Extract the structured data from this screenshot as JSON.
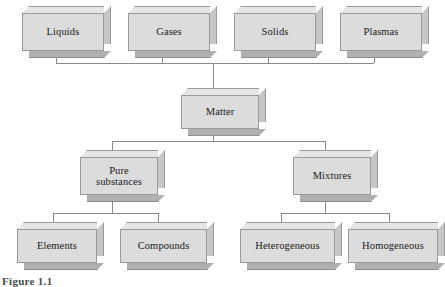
{
  "figure": {
    "caption": "Figure 1.1",
    "root_label": "Matter",
    "line_color": "#8a8a8a",
    "box_face_color": "#dcdcdc",
    "box_top_color": "#e6e6e6",
    "box_right_color": "#c6c6c6",
    "box_bottom_color": "#b0b0b0",
    "box_border_color": "#9a9a9a",
    "text_color": "#1a1a1a",
    "background_color": "#ffffff"
  },
  "nodes": {
    "states": [
      {
        "id": "liquids",
        "label": "Liquids",
        "x": 22,
        "y": 13,
        "w": 82,
        "h": 38
      },
      {
        "id": "gases",
        "label": "Gases",
        "x": 128,
        "y": 13,
        "w": 82,
        "h": 38
      },
      {
        "id": "solids",
        "label": "Solids",
        "x": 234,
        "y": 13,
        "w": 82,
        "h": 38
      },
      {
        "id": "plasmas",
        "label": "Plasmas",
        "x": 340,
        "y": 13,
        "w": 82,
        "h": 38
      }
    ],
    "root": {
      "id": "matter",
      "label": "Matter",
      "x": 181,
      "y": 95,
      "w": 78,
      "h": 34
    },
    "level2": [
      {
        "id": "pure-substances",
        "label": "Pure\nsubstances",
        "x": 80,
        "y": 157,
        "w": 78,
        "h": 38
      },
      {
        "id": "mixtures",
        "label": "Mixtures",
        "x": 293,
        "y": 157,
        "w": 78,
        "h": 38
      }
    ],
    "level3": [
      {
        "id": "elements",
        "label": "Elements",
        "x": 17,
        "y": 229,
        "w": 80,
        "h": 34
      },
      {
        "id": "compounds",
        "label": "Compounds",
        "x": 120,
        "y": 229,
        "w": 87,
        "h": 34
      },
      {
        "id": "heterogeneous",
        "label": "Heterogeneous",
        "x": 240,
        "y": 229,
        "w": 95,
        "h": 34
      },
      {
        "id": "homogeneous",
        "label": "Homogeneous",
        "x": 348,
        "y": 229,
        "w": 90,
        "h": 34
      }
    ]
  },
  "connectors": {
    "states_bus_y": 63,
    "states_drop_xs": [
      56,
      162,
      268,
      374
    ],
    "root_top_x": 213,
    "root_bottom_x": 213,
    "split1_bus_y": 141,
    "split1_xs": [
      112,
      325
    ],
    "split2_left_bus_y": 213,
    "split2_left_xs": [
      53,
      158
    ],
    "split2_left_parent_x": 112,
    "split2_right_bus_y": 213,
    "split2_right_xs": [
      281,
      389
    ],
    "split2_right_parent_x": 325
  }
}
